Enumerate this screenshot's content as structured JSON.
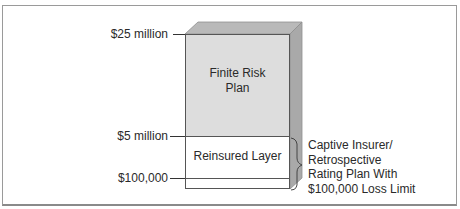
{
  "diagram": {
    "levels": [
      {
        "label": "$25 million"
      },
      {
        "label": "$5 million"
      },
      {
        "label": "$100,000"
      }
    ],
    "blocks": {
      "upper": {
        "line1": "Finite Risk",
        "line2": "Plan"
      },
      "middle": {
        "label": "Reinsured Layer"
      }
    },
    "bracket_annotation": {
      "lines": [
        "Captive Insurer/",
        "Retrospective",
        "Rating Plan With",
        "$100,000 Loss Limit"
      ]
    },
    "colors": {
      "front_face": "#dddddd",
      "top_face": "#b9b9b9",
      "side_face": "#a9a9a9",
      "reinsured_layer": "#ffffff"
    }
  }
}
